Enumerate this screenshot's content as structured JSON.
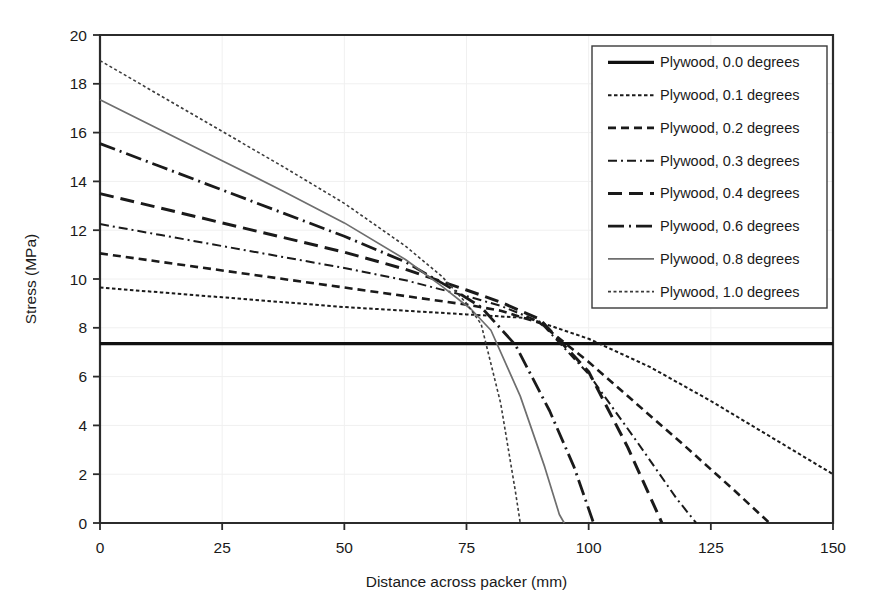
{
  "chart_data": {
    "type": "line",
    "title": "",
    "xlabel": "Distance across packer (mm)",
    "ylabel": "Stress (MPa)",
    "xlim": [
      0,
      150
    ],
    "ylim": [
      0,
      20
    ],
    "xticks": [
      0,
      25,
      50,
      75,
      100,
      125,
      150
    ],
    "yticks": [
      0,
      2,
      4,
      6,
      8,
      10,
      12,
      14,
      16,
      18,
      20
    ],
    "grid": true,
    "legend_position": "top-right",
    "series": [
      {
        "name": "Plywood, 0.0 degrees",
        "style": "solid",
        "color": "#111111",
        "width": 3.2,
        "dash": "none",
        "x": [
          0,
          25,
          50,
          75,
          100,
          125,
          150
        ],
        "y": [
          7.35,
          7.35,
          7.35,
          7.35,
          7.35,
          7.35,
          7.35
        ]
      },
      {
        "name": "Plywood, 0.1 degrees",
        "style": "dotted",
        "color": "#1a1a1a",
        "width": 2.0,
        "dash": "3.5,2.5",
        "x": [
          0,
          12.5,
          25,
          37.5,
          50,
          62.5,
          75,
          87.5,
          100,
          112.5,
          125,
          137.5,
          150
        ],
        "y": [
          9.65,
          9.45,
          9.25,
          9.05,
          8.85,
          8.7,
          8.55,
          8.4,
          7.55,
          6.4,
          5.0,
          3.5,
          2.0
        ]
      },
      {
        "name": "Plywood, 0.2 degrees",
        "style": "dashed",
        "color": "#1a1a1a",
        "width": 2.6,
        "dash": "8,5",
        "x": [
          0,
          12.5,
          25,
          37.5,
          50,
          62.5,
          75,
          82,
          90,
          100,
          110,
          120,
          130,
          137
        ],
        "y": [
          11.05,
          10.7,
          10.35,
          10.0,
          9.65,
          9.3,
          8.95,
          8.7,
          8.2,
          6.6,
          4.85,
          3.1,
          1.3,
          0.0
        ]
      },
      {
        "name": "Plywood, 0.3 degrees",
        "style": "dashdot",
        "color": "#1a1a1a",
        "width": 2.0,
        "dash": "9,4,2,4",
        "x": [
          0,
          12.5,
          25,
          37.5,
          50,
          62.5,
          75,
          82,
          90,
          100,
          110,
          118,
          122
        ],
        "y": [
          12.25,
          11.8,
          11.35,
          10.9,
          10.45,
          9.95,
          9.3,
          8.9,
          8.25,
          6.1,
          3.3,
          1.0,
          0.0
        ]
      },
      {
        "name": "Plywood, 0.4 degrees",
        "style": "longdash",
        "color": "#1a1a1a",
        "width": 3.0,
        "dash": "14,7",
        "x": [
          0,
          12.5,
          25,
          37.5,
          50,
          62.5,
          75,
          82,
          90,
          100,
          108,
          115
        ],
        "y": [
          13.5,
          12.9,
          12.3,
          11.7,
          11.1,
          10.4,
          9.55,
          9.05,
          8.35,
          6.2,
          3.1,
          0.0
        ]
      },
      {
        "name": "Plywood, 0.6 degrees",
        "style": "longdashdot",
        "color": "#1a1a1a",
        "width": 2.8,
        "dash": "16,5,2,5",
        "x": [
          0,
          12.5,
          25,
          37.5,
          50,
          62.5,
          72,
          78,
          85,
          92,
          97,
          101
        ],
        "y": [
          15.55,
          14.6,
          13.65,
          12.7,
          11.75,
          10.7,
          9.6,
          8.85,
          7.3,
          4.6,
          2.3,
          0.0
        ]
      },
      {
        "name": "Plywood, 0.8 degrees",
        "style": "solid-thin",
        "color": "#6e6e6e",
        "width": 1.7,
        "dash": "none",
        "x": [
          0,
          12.5,
          25,
          37.5,
          50,
          62.5,
          70,
          76,
          80,
          86,
          91,
          94,
          95
        ],
        "y": [
          17.35,
          16.1,
          14.85,
          13.6,
          12.3,
          10.8,
          9.7,
          8.75,
          7.9,
          5.2,
          2.3,
          0.35,
          0.0
        ]
      },
      {
        "name": "Plywood, 1.0 degrees",
        "style": "fine-dotted",
        "color": "#3a3a3a",
        "width": 1.6,
        "dash": "3,2.5",
        "x": [
          0,
          12.5,
          25,
          37.5,
          50,
          62.5,
          70,
          75,
          78,
          82,
          85,
          86
        ],
        "y": [
          18.95,
          17.5,
          16.05,
          14.6,
          13.1,
          11.35,
          10.1,
          9.0,
          8.15,
          4.9,
          1.3,
          0.0
        ]
      }
    ]
  },
  "legend": {
    "items": [
      "Plywood, 0.0 degrees",
      "Plywood, 0.1 degrees",
      "Plywood, 0.2 degrees",
      "Plywood, 0.3 degrees",
      "Plywood, 0.4 degrees",
      "Plywood, 0.6 degrees",
      "Plywood, 0.8 degrees",
      "Plywood, 1.0 degrees"
    ]
  },
  "axes": {
    "x_title": "Distance across packer (mm)",
    "y_title": "Stress (MPa)",
    "x_tick_labels": [
      "0",
      "25",
      "50",
      "75",
      "100",
      "125",
      "150"
    ],
    "y_tick_labels": [
      "0",
      "2",
      "4",
      "6",
      "8",
      "10",
      "12",
      "14",
      "16",
      "18",
      "20"
    ]
  },
  "colors": {
    "axis": "#2b2b2b",
    "grid": "#f0f0f0",
    "series_dark": "#1a1a1a",
    "series_gray": "#6e6e6e",
    "background": "#ffffff"
  }
}
